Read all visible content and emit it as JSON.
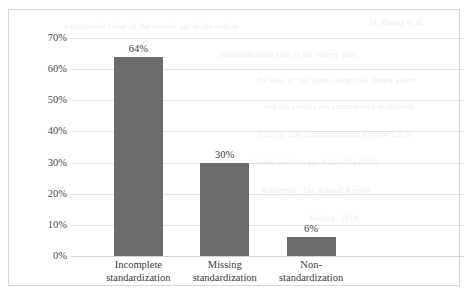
{
  "chart_data": {
    "type": "bar",
    "title": "",
    "subtitle": "",
    "xlabel": "",
    "ylabel": "",
    "categories": [
      "Incomplete standardization",
      "Missing standardization",
      "Non-standardization"
    ],
    "category_lines": [
      [
        "Incomplete",
        "standardization"
      ],
      [
        "Missing",
        "standardization"
      ],
      [
        "Non-",
        "standardization"
      ]
    ],
    "values": [
      64,
      30,
      6
    ],
    "value_labels": [
      "64%",
      "30%",
      "6%"
    ],
    "ylim": [
      0,
      70
    ],
    "ytick_values": [
      70,
      60,
      50,
      40,
      30,
      20,
      10,
      0
    ],
    "ytick_labels": [
      "70%",
      "60%",
      "50%",
      "40%",
      "30%",
      "20%",
      "10%",
      "0%"
    ],
    "grid": true,
    "grid_axis": "y",
    "legend": false,
    "legend_position": "none",
    "bar_color": "#6b6b6b",
    "grid_color": "#e3e3e5",
    "border_color": "#d7d7d9",
    "background_color": "#ffffff"
  },
  "bleed_text": {
    "rows": [
      "a compared value of the sample set in the region",
      "standardization rate of the survey data",
      "the data of the three categories shown above",
      "and the results are summarized as follows",
      "M. Huang et al.",
      "(2019). The Standardization Review 12(3)",
      "Study Results: pp. 421-430 (2018)",
      "Reference: The Annual Report",
      "Beijing: 2019"
    ]
  }
}
